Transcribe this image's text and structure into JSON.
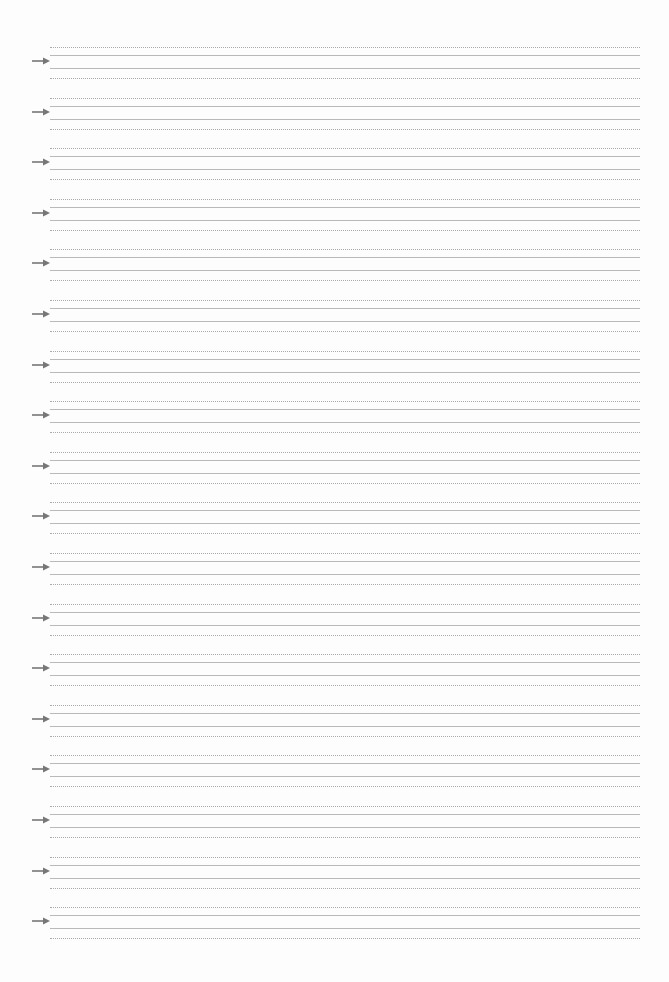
{
  "page": {
    "type": "handwriting-practice-sheet",
    "background_color": "#ffffff",
    "line_color_dotted": "#a9a9a9",
    "line_color_solid": "#b9b9b9",
    "arrow_color": "#777777"
  },
  "practice_rows": {
    "count": 18,
    "first_top": 47,
    "spacing": 50.6,
    "line_offsets": [
      {
        "style": "dotted",
        "offset": 0
      },
      {
        "style": "solid",
        "offset": 8
      },
      {
        "style": "solid",
        "offset": 21
      },
      {
        "style": "dotted",
        "offset": 31
      }
    ],
    "arrow": {
      "icon": "right-arrow-icon",
      "offset": 14
    }
  }
}
